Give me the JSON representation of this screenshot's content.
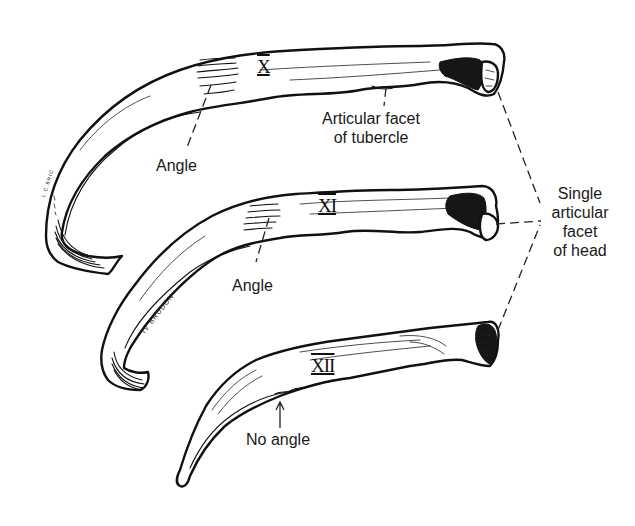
{
  "figure": {
    "background_color": "#ffffff",
    "ink_color": "#111111"
  },
  "ribs": [
    {
      "id": "rib-x",
      "numeral": "X",
      "angle_label": "Angle"
    },
    {
      "id": "rib-xi",
      "numeral": "XI",
      "angle_label": "Angle"
    },
    {
      "id": "rib-xii",
      "numeral": "XII",
      "angle_label": "No angle"
    }
  ],
  "labels": {
    "articular_facet_tubercle": [
      "Articular facet",
      "of tubercle"
    ],
    "single_articular_facet_head": [
      "Single",
      "articular",
      "facet",
      "of head"
    ]
  },
  "signatures": {
    "rib_x": "L.C.BRIC",
    "rib_xi": "IV BRUDON"
  }
}
